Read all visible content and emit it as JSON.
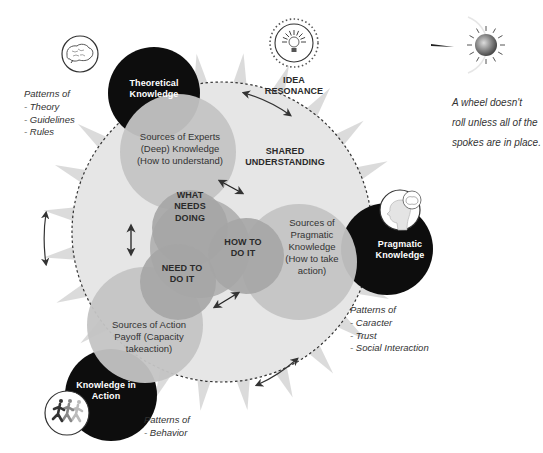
{
  "diagram": {
    "center_label": [
      "SHARED",
      "UNDERSTANDING"
    ],
    "top_icon_label": [
      "IDEA",
      "RESONANCE"
    ],
    "nodes": {
      "theoretical": {
        "label": [
          "Theoretical",
          "Knowledge"
        ],
        "patterns": [
          "Patterns of",
          "- Theory",
          "- Guidelines",
          "- Rules"
        ]
      },
      "pragmatic": {
        "label": [
          "Pragmatic",
          "Knowledge"
        ],
        "patterns": [
          "Patterns of",
          "- Caracter",
          "- Trust",
          "- Social Interaction"
        ]
      },
      "action": {
        "label": [
          "Knowledge in",
          "Action"
        ],
        "patterns": [
          "Patterns of",
          "- Behavior"
        ]
      }
    },
    "sources": {
      "experts": [
        "Sources of Experts",
        "(Deep) Knowledge",
        "(How to understand)"
      ],
      "pragmatic": [
        "Sources of",
        "Pragmatic",
        "Knowledge",
        "(How to take",
        "action)"
      ],
      "action": [
        "Sources of Action",
        "Payoff (Capacity",
        "takeaction)"
      ]
    },
    "inner": {
      "what": [
        "WHAT",
        "NEEDS",
        "DOING"
      ],
      "how": [
        "HOW TO",
        "DO IT"
      ],
      "need": [
        "NEED TO",
        "DO IT"
      ]
    },
    "quote": [
      "A wheel doesn't",
      "roll unless all of the",
      "spokes are in place."
    ],
    "icons": {
      "theoretical": "brain-icon",
      "pragmatic": "head-with-brain-icon",
      "action": "running-people-icon",
      "idea": "lightbulb-icon",
      "wheel": "wheel-hub-icon"
    },
    "colors": {
      "node_fill": "#0d0d0d",
      "wheel_fill": "#e6e6e6",
      "sources_fill": "#c4c4c4",
      "inner_fill": "#a9a9a9",
      "spoke": "#c8c8c8"
    }
  }
}
